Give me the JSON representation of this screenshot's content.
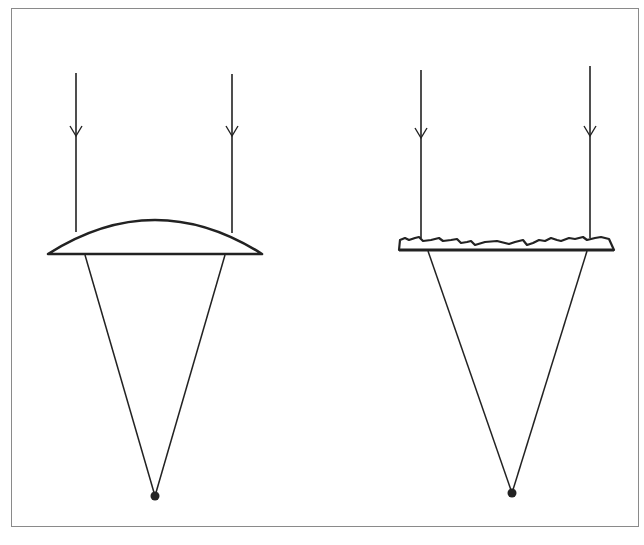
{
  "figure": {
    "colors": {
      "stroke": "#222222",
      "frame": "#8a8a8a",
      "background": "#ffffff"
    },
    "panels": [
      {
        "id": "convex-lens",
        "label": "",
        "rays": [
          {
            "x": 76,
            "y_top": 73,
            "y_lens": 232,
            "arrow_y": 136
          },
          {
            "x": 232,
            "y_top": 74,
            "y_lens": 233,
            "arrow_y": 136
          }
        ],
        "lens": {
          "type": "plano-convex",
          "x_left": 48,
          "x_right": 262,
          "base_y": 254,
          "peak_y": 220
        },
        "cone": {
          "left_x": 85,
          "right_x": 225,
          "top_y": 255
        },
        "focal_point": {
          "x": 155,
          "y": 496,
          "r": 4.5
        }
      },
      {
        "id": "fresnel-lens",
        "label": "",
        "rays": [
          {
            "x": 421,
            "y_top": 70,
            "y_lens": 238,
            "arrow_y": 138
          },
          {
            "x": 590,
            "y_top": 66,
            "y_lens": 238,
            "arrow_y": 136
          }
        ],
        "lens": {
          "type": "fresnel",
          "x_left": 399,
          "x_right": 614,
          "base_y": 250,
          "ridge_top_y": 237
        },
        "cone": {
          "left_x": 428,
          "right_x": 587,
          "top_y": 251
        },
        "focal_point": {
          "x": 512,
          "y": 493,
          "r": 4.5
        }
      }
    ]
  }
}
